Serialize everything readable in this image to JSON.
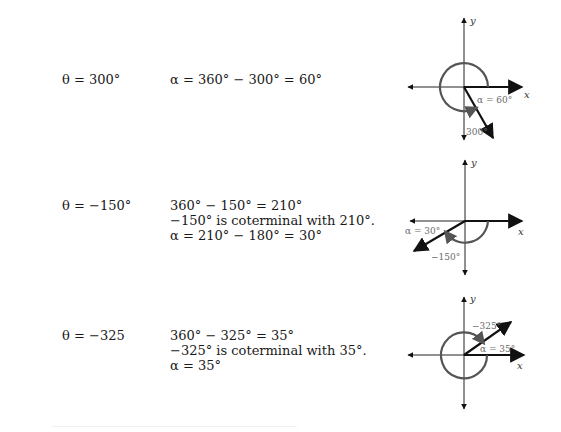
{
  "examples": [
    {
      "theta": "θ = 300°",
      "work": [
        "α = 360° − 300° = 60°"
      ],
      "diagram": {
        "angle_label": "300°",
        "ref_label": "α = 60°",
        "x_axis": "x",
        "y_axis": "y",
        "theta_deg": 300,
        "alpha_deg": 60
      }
    },
    {
      "theta": "θ = −150°",
      "work": [
        "360° − 150° = 210°",
        "−150° is coterminal with 210°.",
        "α = 210° − 180° = 30°"
      ],
      "diagram": {
        "angle_label": "−150°",
        "ref_label": "α = 30°",
        "x_axis": "x",
        "y_axis": "y",
        "theta_deg": -150,
        "alpha_deg": 30
      }
    },
    {
      "theta": "θ = −325",
      "work": [
        "360° − 325° = 35°",
        "−325° is coterminal with 35°.",
        "α = 35°"
      ],
      "diagram": {
        "angle_label": "−325°",
        "ref_label": "α = 35°",
        "x_axis": "x",
        "y_axis": "y",
        "theta_deg": -325,
        "alpha_deg": 35
      }
    }
  ]
}
